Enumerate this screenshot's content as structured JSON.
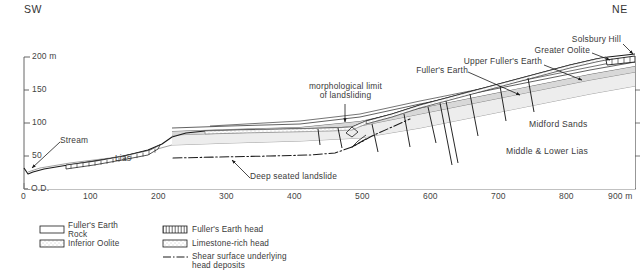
{
  "figure": {
    "type": "geological-cross-section",
    "orientation": {
      "left_label": "SW",
      "right_label": "NE"
    },
    "axes": {
      "y": {
        "datum_label": "O.D.",
        "unit_suffix": "m",
        "ticks": [
          {
            "value": 0,
            "label": "O.D."
          },
          {
            "value": 50,
            "label": "50"
          },
          {
            "value": 100,
            "label": "100"
          },
          {
            "value": 150,
            "label": "150"
          },
          {
            "value": 200,
            "label": "200 m"
          }
        ],
        "range": [
          0,
          210
        ]
      },
      "x": {
        "ticks": [
          {
            "value": 0,
            "label": "0"
          },
          {
            "value": 100,
            "label": "100"
          },
          {
            "value": 200,
            "label": "200"
          },
          {
            "value": 300,
            "label": "300"
          },
          {
            "value": 400,
            "label": "400"
          },
          {
            "value": 500,
            "label": "500"
          },
          {
            "value": 600,
            "label": "600"
          },
          {
            "value": 700,
            "label": "700"
          },
          {
            "value": 800,
            "label": "800"
          },
          {
            "value": 900,
            "label": "900 m"
          }
        ],
        "range": [
          0,
          950
        ]
      }
    },
    "annotations": [
      {
        "id": "stream",
        "text": "Stream"
      },
      {
        "id": "lias",
        "text": "Lias"
      },
      {
        "id": "deep-seated-landslide",
        "text": "Deep seated landslide"
      },
      {
        "id": "morphological-limit",
        "text": "morphological limit\nof landsliding"
      },
      {
        "id": "fullers-earth",
        "text": "Fuller's Earth"
      },
      {
        "id": "upper-fullers-earth",
        "text": "Upper Fuller's Earth"
      },
      {
        "id": "greater-oolite",
        "text": "Greater Oolite"
      },
      {
        "id": "solsbury-hill",
        "text": "Solsbury Hill"
      },
      {
        "id": "midford-sands",
        "text": "Midford Sands"
      },
      {
        "id": "middle-lower-lias",
        "text": "Middle & Lower Lias"
      }
    ],
    "legend": {
      "items": [
        {
          "id": "fullers-earth-rock",
          "label": "Fuller's Earth\nRock",
          "swatch": "solid-white"
        },
        {
          "id": "inferior-oolite",
          "label": "Inferior Oolite",
          "swatch": "stipple-grey"
        },
        {
          "id": "fullers-earth-head",
          "label": "Fuller's Earth head",
          "swatch": "vertical-hatch"
        },
        {
          "id": "limestone-rich-head",
          "label": "Limestone-rich head",
          "swatch": "dotted-fill"
        },
        {
          "id": "shear-surface",
          "label": "Shear surface underlying\nhead deposits",
          "swatch": "dash-dot-line"
        }
      ]
    },
    "colors": {
      "line": "#1a1a1a",
      "text": "#333333",
      "axis": "#555555",
      "band_fill": "#d9d9d9",
      "band_fill_light": "#efefef"
    }
  }
}
